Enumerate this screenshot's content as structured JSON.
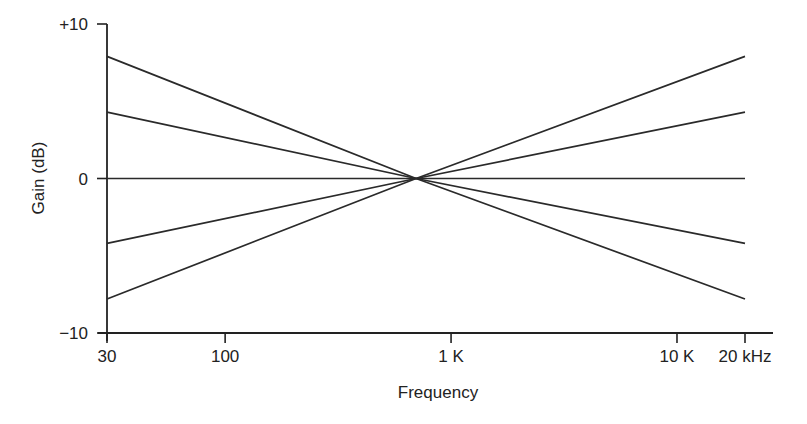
{
  "chart_data": {
    "type": "line",
    "title": "",
    "xlabel": "Frequency",
    "ylabel": "Gain (dB)",
    "x_scale": "log",
    "xlim": [
      30,
      20000
    ],
    "ylim": [
      -10,
      10
    ],
    "grid": false,
    "legend": "none",
    "x_ticks": [
      {
        "value": 30,
        "label": "30"
      },
      {
        "value": 100,
        "label": "100"
      },
      {
        "value": 1000,
        "label": "1 K"
      },
      {
        "value": 10000,
        "label": "10 K"
      },
      {
        "value": 20000,
        "label": "20 kHz"
      }
    ],
    "y_ticks": [
      {
        "value": 10,
        "label": "+10"
      },
      {
        "value": 0,
        "label": "0"
      },
      {
        "value": -10,
        "label": "−10"
      }
    ],
    "pivot_frequency": 700,
    "series": [
      {
        "name": "tilt +8",
        "x": [
          30,
          700,
          20000
        ],
        "values": [
          7.9,
          0,
          -7.8
        ]
      },
      {
        "name": "tilt +4",
        "x": [
          30,
          700,
          20000
        ],
        "values": [
          4.3,
          0,
          -4.2
        ]
      },
      {
        "name": "flat",
        "x": [
          30,
          700,
          20000
        ],
        "values": [
          0,
          0,
          0
        ]
      },
      {
        "name": "tilt -4",
        "x": [
          30,
          700,
          20000
        ],
        "values": [
          -4.2,
          0,
          4.3
        ]
      },
      {
        "name": "tilt -8",
        "x": [
          30,
          700,
          20000
        ],
        "values": [
          -7.8,
          0,
          7.9
        ]
      }
    ],
    "colors": {
      "line": "#2a2a2a",
      "axis": "#222222",
      "background": "#ffffff"
    }
  }
}
